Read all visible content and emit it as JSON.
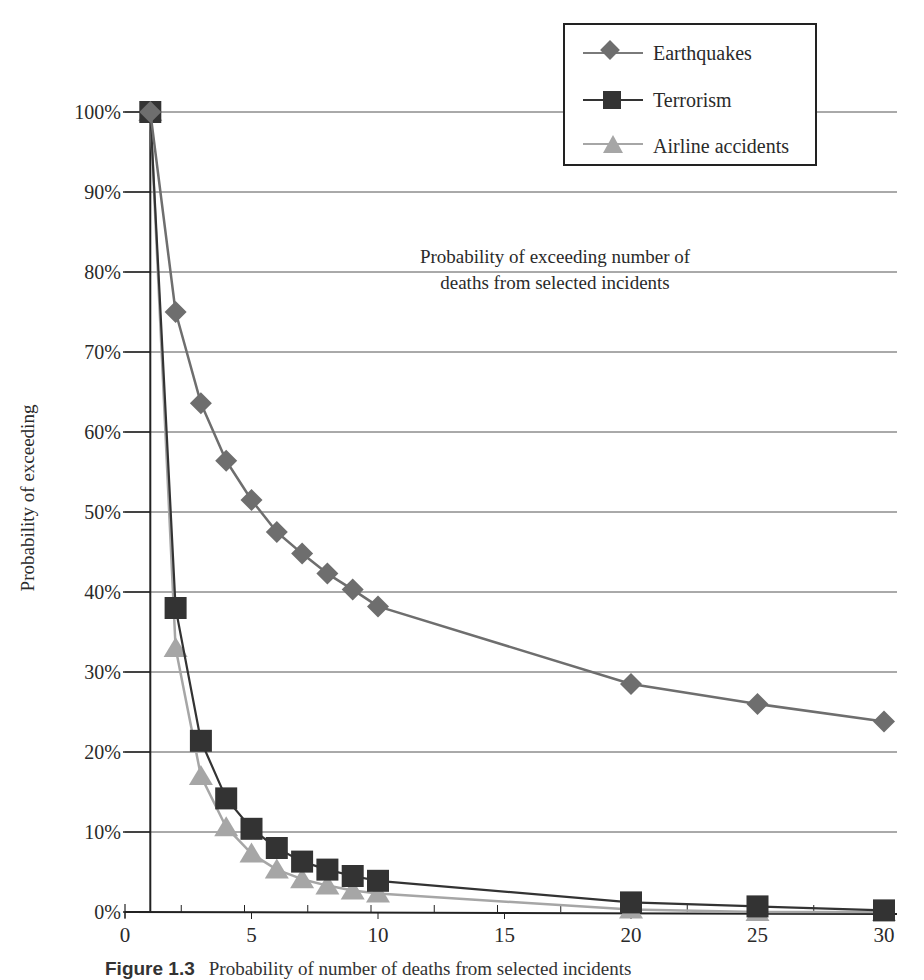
{
  "chart_data": {
    "type": "line",
    "title": "Probability of exceeding number of deaths from selected incidents",
    "annotation_lines": [
      "Probability of exceeding number of",
      "deaths from selected incidents"
    ],
    "xlabel": "",
    "ylabel": "Probability of exceeding",
    "x": [
      1,
      2,
      3,
      4,
      5,
      6,
      7,
      8,
      9,
      10,
      20,
      25,
      30
    ],
    "xlim": [
      0,
      30
    ],
    "ylim": [
      0,
      100
    ],
    "x_ticks": [
      0,
      5,
      10,
      15,
      20,
      25,
      30
    ],
    "y_ticks": [
      "0%",
      "10%",
      "20%",
      "30%",
      "40%",
      "50%",
      "60%",
      "70%",
      "80%",
      "90%",
      "100%"
    ],
    "grid": true,
    "legend_position": "top-right",
    "series": [
      {
        "name": "Earthquakes",
        "marker": "diamond",
        "color": "#6e6e6e",
        "values": [
          100,
          75,
          63.6,
          56.4,
          51.5,
          47.5,
          44.8,
          42.3,
          40.3,
          38.2,
          28.5,
          26,
          23.8
        ]
      },
      {
        "name": "Terrorism",
        "marker": "square",
        "color": "#333333",
        "values": [
          100,
          38,
          21.4,
          14.2,
          10.4,
          8,
          6.3,
          5.3,
          4.5,
          3.9,
          1.2,
          0.7,
          0.2
        ]
      },
      {
        "name": "Airline accidents",
        "marker": "triangle",
        "color": "#a6a6a6",
        "values": [
          100,
          33,
          17,
          10.6,
          7.3,
          5.3,
          4.1,
          3.3,
          2.7,
          2.3,
          0.3,
          0,
          0
        ]
      }
    ]
  },
  "legend": {
    "items": [
      "Earthquakes",
      "Terrorism",
      "Airline accidents"
    ]
  },
  "caption": {
    "label": "Figure 1.3",
    "text": "Probability of number of deaths from selected incidents"
  }
}
